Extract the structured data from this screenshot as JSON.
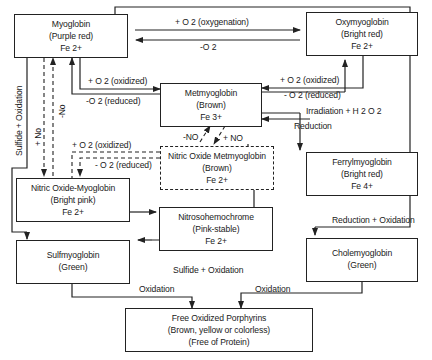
{
  "nodes": {
    "myoglobin": {
      "name": "Myoglobin",
      "color": "(Purple red)",
      "iron": "Fe 2+"
    },
    "oxymyoglobin": {
      "name": "Oxymyoglobin",
      "color": "(Bright red)",
      "iron": "Fe 2+"
    },
    "metmyoglobin": {
      "name": "Metmyoglobin",
      "color": "(Brown)",
      "iron": "Fe 3+"
    },
    "nitric_oxide_metmyoglobin": {
      "name": "Nitric Oxide Metmyoglobin",
      "color": "(Brown)",
      "iron": "Fe 2+"
    },
    "ferrylmyoglobin": {
      "name": "Ferrylmyoglobin",
      "color": "(Bright red)",
      "iron": "Fe 4+"
    },
    "nitric_oxide_myoglobin": {
      "name": "Nitric Oxide-Myoglobin",
      "color": "(Bright pink)",
      "iron": "Fe 2+"
    },
    "nitrosohemochrome": {
      "name": "Nitrosohemochrome",
      "color": "(Pink-stable)",
      "iron": "Fe 2+"
    },
    "sulfmyoglobin": {
      "name": "Sulfmyoglobin",
      "color": "(Green)"
    },
    "cholemyoglobin": {
      "name": "Cholemyoglobin",
      "color": "(Green)"
    },
    "free_oxidized_porphyrins": {
      "name": "Free Oxidized Porphyrins",
      "color": "(Brown, yellow or colorless)",
      "note": "(Free of Protein)"
    }
  },
  "edges": {
    "oxygenation": "+ O 2  (oxygenation)",
    "deoxygenation": "-O 2",
    "myo_to_met_oxidized": "+ O 2 (oxidized)",
    "met_to_myo_reduced": "-O 2   (reduced)",
    "met_to_oxy_oxidized": "+ O 2  (oxidized)",
    "oxy_to_met_reduced": "- O 2 (reduced)",
    "irradiation": "Irradiation + H 2 O 2",
    "reduction": "Reduction",
    "minus_no": "-NO",
    "plus_no": "+ NO",
    "nomyo_oxidized": "+ O 2  (oxidized)",
    "nomyo_reduced": "- O 2 (reduced)",
    "sulfide_oxidation_left": "Sulfide + Oxidation",
    "plus_no_vertical": "+ No",
    "minus_no_vertical": "-No",
    "sulfide_oxidation_bottom": "Sulfide + Oxidation",
    "reduction_oxidation": "Reduction + Oxidation",
    "oxidation_left": "Oxidation",
    "oxidation_right": "Oxidation"
  },
  "colors": {
    "line": "#222222",
    "background": "#ffffff"
  }
}
